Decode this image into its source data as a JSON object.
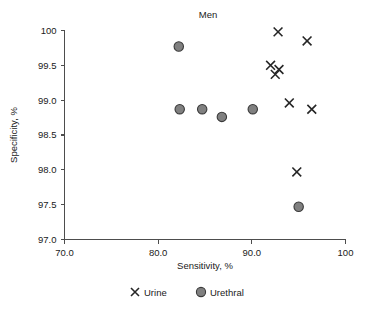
{
  "chart_data": {
    "type": "scatter",
    "title": "Men",
    "xlabel": "Sensitivity, %",
    "ylabel": "Specificity, %",
    "xlim": [
      70,
      100
    ],
    "ylim": [
      97.0,
      100.0
    ],
    "xticks": [
      70,
      80,
      90,
      100
    ],
    "xtick_labels": [
      "70.0",
      "80.0",
      "90.0",
      "100"
    ],
    "yticks": [
      97.0,
      97.5,
      98.0,
      98.5,
      99.0,
      99.5,
      100.0
    ],
    "ytick_labels": [
      "97.0",
      "97.5",
      "98.0",
      "98.5",
      "99.0",
      "99.5",
      "100"
    ],
    "grid": false,
    "legend_position": "below",
    "series": [
      {
        "name": "Urine",
        "marker": "cross",
        "color": "#262626",
        "points": [
          {
            "x": 92.8,
            "y": 99.98
          },
          {
            "x": 95.9,
            "y": 99.85
          },
          {
            "x": 92.0,
            "y": 99.5
          },
          {
            "x": 92.9,
            "y": 99.44
          },
          {
            "x": 92.5,
            "y": 99.37
          },
          {
            "x": 94.0,
            "y": 98.96
          },
          {
            "x": 96.4,
            "y": 98.87
          },
          {
            "x": 94.8,
            "y": 97.97
          }
        ]
      },
      {
        "name": "Urethral",
        "marker": "circle",
        "color": "#808080",
        "points": [
          {
            "x": 82.2,
            "y": 99.77
          },
          {
            "x": 82.3,
            "y": 98.87
          },
          {
            "x": 84.7,
            "y": 98.87
          },
          {
            "x": 86.8,
            "y": 98.76
          },
          {
            "x": 90.1,
            "y": 98.87
          },
          {
            "x": 95.0,
            "y": 97.47
          }
        ]
      }
    ]
  },
  "legend": {
    "items": [
      {
        "label": "Urine",
        "marker": "cross"
      },
      {
        "label": "Urethral",
        "marker": "circle"
      }
    ]
  }
}
